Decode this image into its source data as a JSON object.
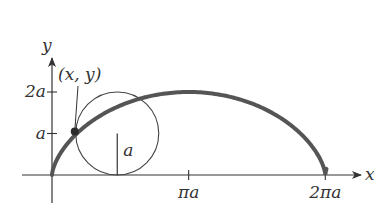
{
  "diagram": {
    "curve": "cycloid",
    "parameter_range_turns": [
      0,
      1
    ],
    "colors": {
      "curve": "#555555",
      "axes": "#333333",
      "circle": "#444444",
      "point": "#2a2a2a",
      "background": "#ffffff"
    },
    "axes": {
      "x_label": "x",
      "y_label": "y"
    },
    "x_ticks": [
      {
        "value_in_a": 3.14159265,
        "label": "πa"
      },
      {
        "value_in_a": 6.28318531,
        "label": "2πa"
      }
    ],
    "y_ticks": [
      {
        "value_in_a": 1,
        "label": "a"
      },
      {
        "value_in_a": 2,
        "label": "2a"
      }
    ],
    "rolling_circle": {
      "center_x_in_a": 1.5,
      "center_y_in_a": 1,
      "radius_in_a": 1,
      "radius_label": "a"
    },
    "traced_point": {
      "label": "(x, y)"
    }
  }
}
